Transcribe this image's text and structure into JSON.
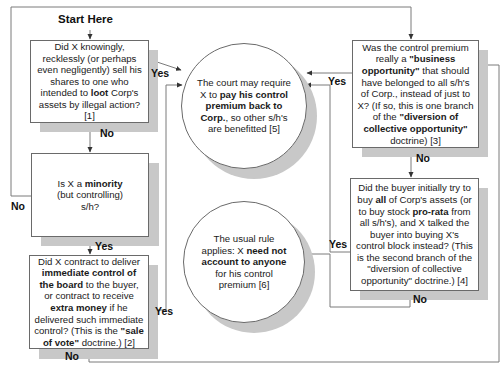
{
  "diagram": {
    "start_label": "Start Here",
    "nodes": {
      "q1_loot": {
        "type": "decision",
        "parts": [
          {
            "t": "Did X knowingly, recklessly (or perhaps even negligently) sell his shares to one who intended to "
          },
          {
            "t": "loot",
            "b": true
          },
          {
            "t": " Corp's assets by illegal action? [1]"
          }
        ]
      },
      "q2_minority": {
        "type": "decision",
        "parts": [
          {
            "t": "Is X a "
          },
          {
            "t": "minority",
            "b": true
          },
          {
            "t": " (but controlling) s/h?"
          }
        ]
      },
      "q3_sale_of_vote": {
        "type": "decision",
        "parts": [
          {
            "t": "Did X contract to deliver "
          },
          {
            "t": "immediate control of the board",
            "b": true
          },
          {
            "t": " to the buyer, or contract to receive "
          },
          {
            "t": "extra money",
            "b": true
          },
          {
            "t": " if he delivered such immediate control? (This is the "
          },
          {
            "t": "\"sale of vote\"",
            "b": true
          },
          {
            "t": " doctrine.) [2]"
          }
        ]
      },
      "q4_business_opportunity": {
        "type": "decision",
        "parts": [
          {
            "t": "Was the control premium really a "
          },
          {
            "t": "\"business opportunity\"",
            "b": true
          },
          {
            "t": " that should have belonged to all s/h's of Corp., instead of just to X? (If so, this is one branch of the "
          },
          {
            "t": "\"diversion of collective opportunity\"",
            "b": true
          },
          {
            "t": " doctrine) [3]"
          }
        ]
      },
      "q5_buyer_all_assets": {
        "type": "decision",
        "parts": [
          {
            "t": "Did the buyer initially try to buy "
          },
          {
            "t": "all",
            "b": true
          },
          {
            "t": " of Corp's assets (or to buy stock "
          },
          {
            "t": "pro-rata",
            "b": true
          },
          {
            "t": " from all s/h's), and X talked the buyer into buying X's control block instead? (This is the second branch of the \"diversion of collective opportunity\" doctrine.) [4]"
          }
        ]
      },
      "r1_pay_back": {
        "type": "result",
        "parts": [
          {
            "t": "The court may require X to "
          },
          {
            "t": "pay his control premium back to Corp.",
            "b": true
          },
          {
            "t": ", so other s/h's are benefitted [5]"
          }
        ]
      },
      "r2_usual_rule": {
        "type": "result",
        "parts": [
          {
            "t": "The usual rule applies: X "
          },
          {
            "t": "need not account to anyone",
            "b": true
          },
          {
            "t": " for his control premium [6]"
          }
        ]
      }
    },
    "edge_labels": {
      "q1_yes": "Yes",
      "q1_no": "No",
      "q2_no": "No",
      "q2_yes": "Yes",
      "q3_yes": "Yes",
      "q3_no": "No",
      "q4_yes": "Yes",
      "q4_no": "No",
      "q5_yes": "Yes",
      "q5_no": "No"
    },
    "edges": [
      {
        "from": "start",
        "to": "q1_loot"
      },
      {
        "from": "q1_loot",
        "to": "r1_pay_back",
        "label": "Yes"
      },
      {
        "from": "q1_loot",
        "to": "q2_minority",
        "label": "No"
      },
      {
        "from": "q2_minority",
        "to": "q4_business_opportunity",
        "label": "No"
      },
      {
        "from": "q2_minority",
        "to": "q3_sale_of_vote",
        "label": "Yes"
      },
      {
        "from": "q3_sale_of_vote",
        "to": "r1_pay_back",
        "label": "Yes"
      },
      {
        "from": "q3_sale_of_vote",
        "to": "q4_business_opportunity",
        "label": "No"
      },
      {
        "from": "q4_business_opportunity",
        "to": "r1_pay_back",
        "label": "Yes"
      },
      {
        "from": "q4_business_opportunity",
        "to": "q5_buyer_all_assets",
        "label": "No"
      },
      {
        "from": "q5_buyer_all_assets",
        "to": "r1_pay_back",
        "label": "Yes"
      },
      {
        "from": "q5_buyer_all_assets",
        "to": "r2_usual_rule",
        "label": "No"
      }
    ],
    "colors": {
      "line": "#6a6a6a",
      "shadow": "#c8c8c8",
      "box_fill": "#ffffff"
    }
  }
}
